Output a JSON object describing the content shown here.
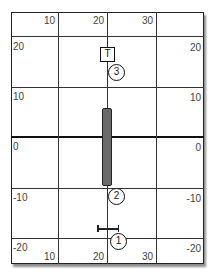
{
  "diagram": {
    "top_x_labels": [
      "10",
      "20",
      "30"
    ],
    "bottom_x_labels": [
      "10",
      "20",
      "30"
    ],
    "left_y_labels": [
      "20",
      "10",
      "0",
      "-10",
      "-20"
    ],
    "right_y_labels": [
      "20",
      "10",
      "0",
      "-10",
      "-20"
    ],
    "markers": {
      "target": {
        "label": "T",
        "shape": "square",
        "x": 20,
        "y": 22
      },
      "point3": {
        "label": "3",
        "shape": "circle",
        "x": 22,
        "y": 18
      },
      "point2": {
        "label": "2",
        "shape": "circle",
        "x": 22,
        "y": -12
      },
      "point1": {
        "label": "1",
        "shape": "circle",
        "x": 22,
        "y": -22
      }
    },
    "bar": {
      "x": 20,
      "y_top": 6,
      "y_bottom": -10,
      "color": "#6a6a6a"
    },
    "error_bar": {
      "x_from": 18,
      "x_to": 23,
      "y": -19
    },
    "colors": {
      "grid": "#333333",
      "axis": "#111111",
      "bar": "#6a6a6a"
    }
  }
}
